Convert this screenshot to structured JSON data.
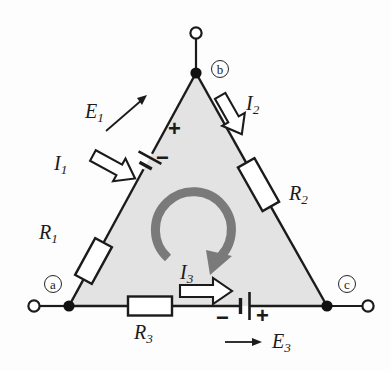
{
  "figure": {
    "background_color": "#fdfdfd",
    "wire_color": "#1b1b1b",
    "triangle_fill": "#e3e3e3",
    "loop_arrow_color": "#7a7a7a",
    "arrow_outline_color": "#1b1b1b",
    "arrow_fill_color": "#ffffff"
  },
  "nodes": [
    {
      "id": "a",
      "label": "a",
      "x": 69,
      "y": 306
    },
    {
      "id": "b",
      "label": "b",
      "x": 196,
      "y": 73
    },
    {
      "id": "c",
      "label": "c",
      "x": 327,
      "y": 306
    }
  ],
  "terminals": [
    {
      "id": "terminal-b-top",
      "x": 196,
      "y": 33
    },
    {
      "id": "terminal-a-left",
      "x": 34,
      "y": 306
    },
    {
      "id": "terminal-c-right",
      "x": 368,
      "y": 306
    }
  ],
  "resistors": [
    {
      "id": "R1",
      "label": "R",
      "subscript": "1",
      "branch": "a-b"
    },
    {
      "id": "R2",
      "label": "R",
      "subscript": "2",
      "branch": "b-c"
    },
    {
      "id": "R3",
      "label": "R",
      "subscript": "3",
      "branch": "a-c"
    }
  ],
  "sources": [
    {
      "id": "E1",
      "label": "E",
      "subscript": "1",
      "branch": "a-b",
      "plus_sign": "+",
      "minus_sign": "−",
      "polarity_note": "plus toward b, minus toward a"
    },
    {
      "id": "E3",
      "label": "E",
      "subscript": "3",
      "branch": "a-c",
      "plus_sign": "+",
      "minus_sign": "−",
      "polarity_note": "minus on left, plus on right"
    }
  ],
  "currents": [
    {
      "id": "I1",
      "label": "I",
      "subscript": "1",
      "branch": "a-b",
      "direction": "up-right toward b"
    },
    {
      "id": "I2",
      "label": "I",
      "subscript": "2",
      "branch": "b-c",
      "direction": "down-right toward c"
    },
    {
      "id": "I3",
      "label": "I",
      "subscript": "3",
      "branch": "a-c",
      "direction": "right toward c"
    }
  ],
  "loop": {
    "id": "mesh-loop",
    "direction": "clockwise",
    "center_x": 196,
    "center_y": 228,
    "radius": 38
  }
}
